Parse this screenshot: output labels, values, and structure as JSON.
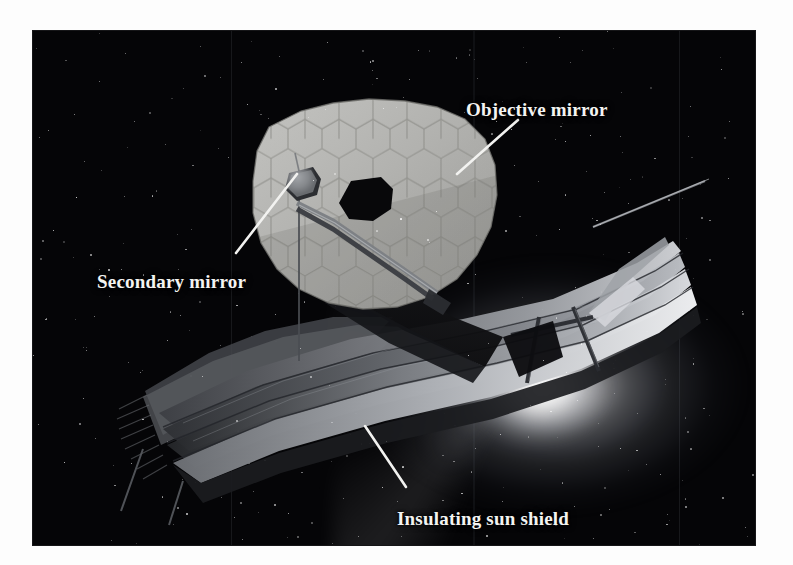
{
  "figure": {
    "background_color": "#050507",
    "page_color": "#ffffff",
    "label_color": "#f4f4f2",
    "mirror_color": "#b0b0ae",
    "sunshield_color": "#8d8f93",
    "glow_color": "#ffffff"
  },
  "labels": [
    {
      "id": "objective-mirror",
      "text": "Objective mirror",
      "leader": {
        "x1": 518,
        "y1": 120,
        "x2": 457,
        "y2": 174
      }
    },
    {
      "id": "secondary-mirror",
      "text": "Secondary mirror",
      "leader": {
        "x1": 236,
        "y1": 253,
        "x2": 297,
        "y2": 174
      }
    },
    {
      "id": "insulating-sun-shield",
      "text": "Insulating sun shield",
      "leader": {
        "x1": 365,
        "y1": 426,
        "x2": 406,
        "y2": 487
      }
    }
  ],
  "plate": {
    "left": 33,
    "top": 31,
    "width": 722,
    "height": 514
  },
  "components": {
    "primary_mirror": "hexagonal segmented objective mirror with central aperture",
    "secondary_mirror": "secondary mirror on tripod boom",
    "sun_shield": "multi-layer insulating sun shield",
    "sun": "bright solar glare behind the shield"
  }
}
